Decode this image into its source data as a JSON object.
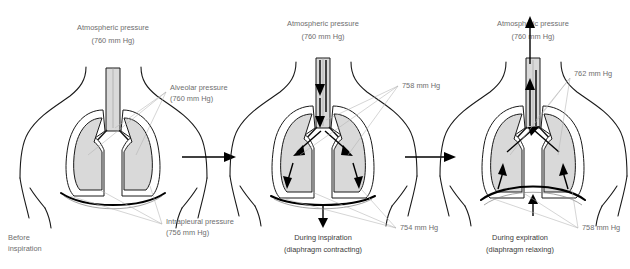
{
  "figure": {
    "panels": [
      {
        "id": "before-inspiration",
        "header": {
          "line1": "Atmospheric pressure",
          "line2": "(760 mm Hg)"
        },
        "caption": {
          "line1": "Before",
          "line2": "inspiration"
        },
        "labels": [
          {
            "name": "alveolar-pressure",
            "line1": "Alveolar pressure",
            "line2": "(760 mm Hg)"
          },
          {
            "name": "intrapleural-pressure",
            "line1": "Intrapleural pressure",
            "line2": "(756 mm Hg)"
          }
        ]
      },
      {
        "id": "during-inspiration",
        "header": {
          "line1": "Atmospheric pressure",
          "line2": "(760 mm Hg)"
        },
        "caption": {
          "line1": "During inspiration",
          "line2": "(diaphragm contracting)"
        },
        "labels": [
          {
            "name": "alveolar-pressure-value",
            "line1": "758 mm Hg",
            "line2": ""
          },
          {
            "name": "intrapleural-pressure-value",
            "line1": "754 mm Hg",
            "line2": ""
          }
        ]
      },
      {
        "id": "during-expiration",
        "header": {
          "line1": "Atmospheric pressure",
          "line2": "(760 mm Hg)"
        },
        "caption": {
          "line1": "During expiration",
          "line2": "(diaphragm relaxing)"
        },
        "labels": [
          {
            "name": "alveolar-pressure-value",
            "line1": "762 mm Hg",
            "line2": ""
          },
          {
            "name": "intrapleural-pressure-value",
            "line1": "758 mm Hg",
            "line2": ""
          }
        ]
      }
    ],
    "colors": {
      "lung_fill": "#d9d9d9",
      "outline": "#1a1a1a",
      "label_text": "#6e6e6e",
      "caption_text": "#3a3a3a",
      "leader_line": "#b2b2b2",
      "background": "#ffffff"
    }
  }
}
